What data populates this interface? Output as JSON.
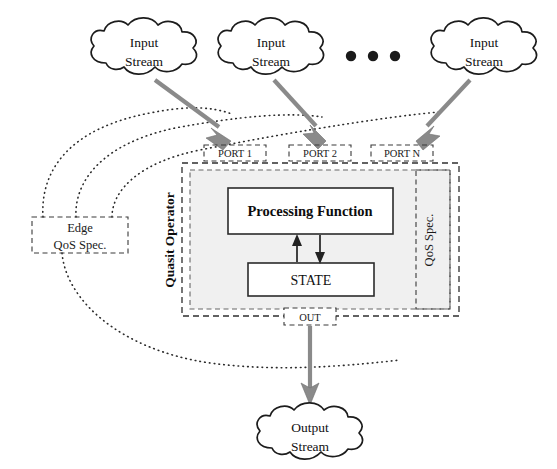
{
  "diagram": {
    "colors": {
      "background": "#ffffff",
      "stream_arrow": "#8a8a8a",
      "outline": "#1c1c1c",
      "shaded_region": "#f0f0f0",
      "dotted_link": "#2a2a2a"
    },
    "input_streams": [
      {
        "id": "input-1",
        "line1": "Input",
        "line2": "Stream"
      },
      {
        "id": "input-2",
        "line1": "Input",
        "line2": "Stream"
      },
      {
        "id": "input-3",
        "line1": "Input",
        "line2": "Stream"
      }
    ],
    "ellipsis": "• • •",
    "ports": [
      {
        "id": "port-1",
        "label": "PORT 1"
      },
      {
        "id": "port-2",
        "label": "PORT 2"
      },
      {
        "id": "port-n",
        "label": "PORT N"
      }
    ],
    "operator": {
      "name": "Quasit Operator",
      "qos_spec": "QoS Spec.",
      "processing_function": "Processing Function",
      "state": "STATE",
      "out_port": "OUT"
    },
    "edge_qos": {
      "line1": "Edge",
      "line2": "QoS Spec."
    },
    "output_stream": {
      "line1": "Output",
      "line2": "Stream"
    }
  }
}
